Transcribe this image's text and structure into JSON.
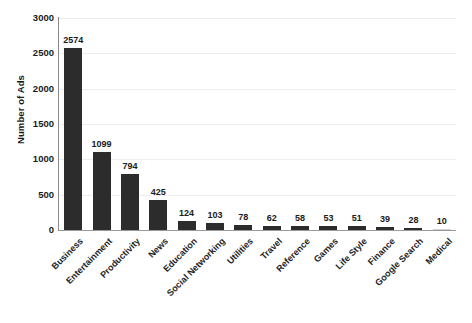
{
  "chart_data": {
    "type": "bar",
    "title": "",
    "subtitle": "",
    "xlabel": "",
    "ylabel": "Number of Ads",
    "ylim": [
      0,
      3000
    ],
    "ytick_labels": [
      "3000",
      "2500",
      "2000",
      "1500",
      "1000",
      "500",
      "0"
    ],
    "yticks": [
      3000,
      2500,
      2000,
      1500,
      1000,
      500,
      0
    ],
    "grid": true,
    "grid_axis": "y",
    "legend": false,
    "legend_position": "none",
    "bar_color": "#2c2c2c",
    "categories": [
      "Business",
      "Entertainment",
      "Productivity",
      "News",
      "Education",
      "Social Networking",
      "Utilities",
      "Travel",
      "Reference",
      "Games",
      "Life Style",
      "Finance",
      "Google Search",
      "Medical"
    ],
    "values": [
      2574,
      1099,
      794,
      425,
      124,
      103,
      78,
      62,
      58,
      53,
      51,
      39,
      28,
      10
    ],
    "data_labels": [
      "2574",
      "1099",
      "794",
      "425",
      "124",
      "103",
      "78",
      "62",
      "58",
      "53",
      "51",
      "39",
      "28",
      "10"
    ]
  }
}
